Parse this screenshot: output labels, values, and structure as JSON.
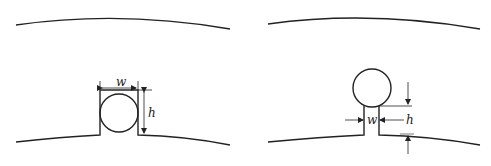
{
  "figure": {
    "panels": [
      {
        "id": "left",
        "description": "Slot with embedded circular conductor, slot width equals conductor diameter",
        "labels": {
          "width": "w",
          "height": "h"
        }
      },
      {
        "id": "right",
        "description": "Narrow slot opening below circular conductor",
        "labels": {
          "width": "w",
          "height": "h"
        }
      }
    ],
    "colors": {
      "stroke": "#222222",
      "background": "#ffffff"
    }
  }
}
